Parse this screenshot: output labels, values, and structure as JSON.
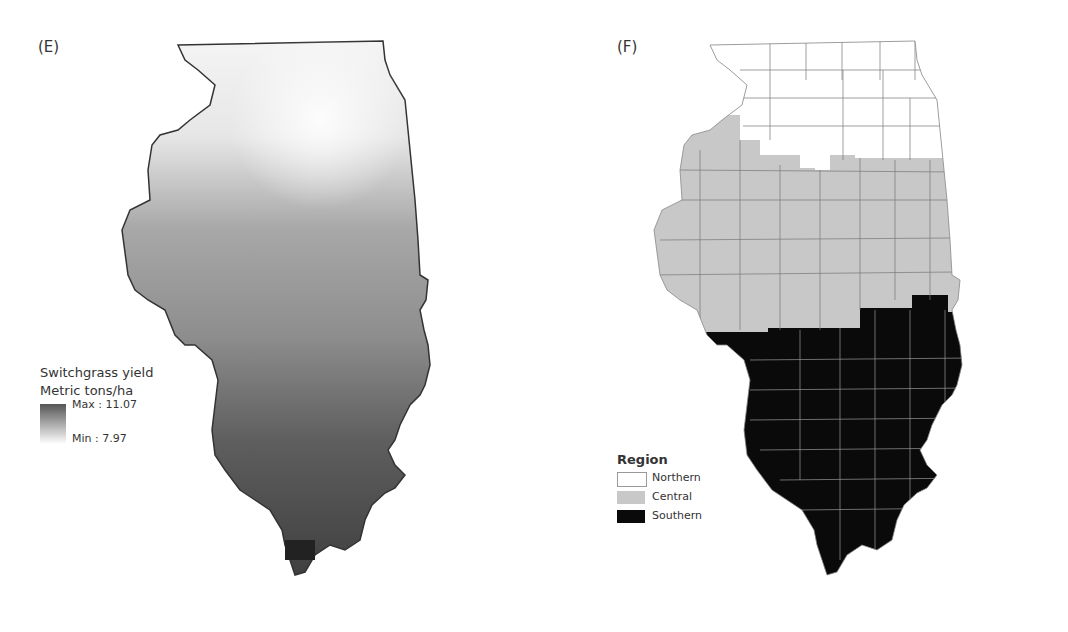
{
  "figure": {
    "panels": [
      {
        "label": "(E)",
        "type": "continuous-map",
        "subject": "Illinois",
        "legend": {
          "title": "Switchgrass yield",
          "subtitle": "Metric tons/ha",
          "max_label": "Max : 11.07",
          "min_label": "Min : 7.97",
          "max_value": 11.07,
          "min_value": 7.97,
          "color_high": "#555555",
          "color_low": "#ffffff"
        }
      },
      {
        "label": "(F)",
        "type": "region-map",
        "subject": "Illinois counties",
        "legend": {
          "title": "Region",
          "items": [
            {
              "label": "Northern",
              "color": "#ffffff"
            },
            {
              "label": "Central",
              "color": "#c8c8c8"
            },
            {
              "label": "Southern",
              "color": "#0a0a0a"
            }
          ]
        }
      }
    ]
  }
}
